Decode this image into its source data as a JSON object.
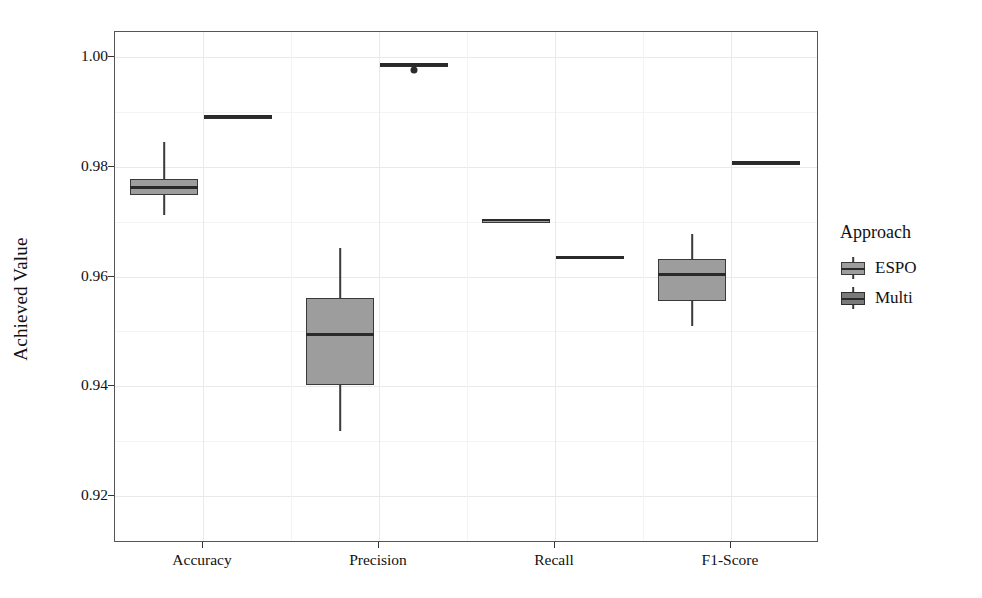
{
  "chart_data": {
    "type": "boxplot",
    "title": "",
    "xlabel": "",
    "ylabel": "Achieved Value",
    "categories": [
      "Accuracy",
      "Precision",
      "Recall",
      "F1-Score"
    ],
    "ylim": [
      0.9115,
      1.0045
    ],
    "yticks": [
      0.92,
      0.94,
      0.96,
      0.98,
      1.0
    ],
    "ytick_labels": [
      "0.92",
      "0.94",
      "0.96",
      "0.98",
      "1.00"
    ],
    "grid": true,
    "legend": {
      "title": "Approach",
      "position": "right",
      "entries": [
        {
          "label": "ESPO",
          "fill": "#9d9d9d",
          "stroke": "#3a3a3a"
        },
        {
          "label": "Multi",
          "fill": "#7a7a7a",
          "stroke": "#2f2f2f"
        }
      ]
    },
    "series": [
      {
        "name": "ESPO",
        "boxes": [
          {
            "category": "Accuracy",
            "min": 0.9712,
            "q1": 0.9748,
            "median": 0.9762,
            "q3": 0.9778,
            "max": 0.9845,
            "outliers": []
          },
          {
            "category": "Precision",
            "min": 0.9318,
            "q1": 0.9403,
            "median": 0.9494,
            "q3": 0.9561,
            "max": 0.9651,
            "outliers": []
          },
          {
            "category": "Recall",
            "min": 0.9702,
            "q1": 0.9702,
            "median": 0.9703,
            "q3": 0.9704,
            "max": 0.9705,
            "outliers": []
          },
          {
            "category": "F1-Score",
            "min": 0.951,
            "q1": 0.9556,
            "median": 0.9604,
            "q3": 0.9632,
            "max": 0.9678,
            "outliers": []
          }
        ]
      },
      {
        "name": "Multi",
        "boxes": [
          {
            "category": "Accuracy",
            "min": 0.989,
            "q1": 0.989,
            "median": 0.9891,
            "q3": 0.9892,
            "max": 0.9892,
            "outliers": []
          },
          {
            "category": "Precision",
            "min": 0.9985,
            "q1": 0.9985,
            "median": 0.9986,
            "q3": 0.9987,
            "max": 0.9987,
            "outliers": [
              0.9975
            ]
          },
          {
            "category": "Recall",
            "min": 0.9634,
            "q1": 0.9634,
            "median": 0.9635,
            "q3": 0.9637,
            "max": 0.9638,
            "outliers": []
          },
          {
            "category": "F1-Score",
            "min": 0.9806,
            "q1": 0.9807,
            "median": 0.9808,
            "q3": 0.9809,
            "max": 0.981,
            "outliers": []
          }
        ]
      }
    ]
  },
  "axis": {
    "y_label": "Achieved Value",
    "y_ticks": [
      "0.92",
      "0.94",
      "0.96",
      "0.98",
      "1.00"
    ],
    "x_ticks": [
      "Accuracy",
      "Precision",
      "Recall",
      "F1-Score"
    ]
  },
  "legend": {
    "title": "Approach",
    "items": [
      {
        "label": "ESPO"
      },
      {
        "label": "Multi"
      }
    ]
  }
}
